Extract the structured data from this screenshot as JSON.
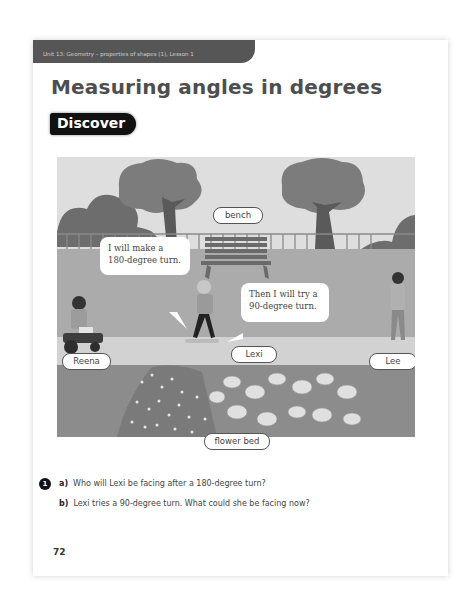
{
  "header": {
    "unit_label": "Unit 13: Geometry – properties of shapes (1), Lesson 1",
    "title": "Measuring angles in degrees",
    "section_badge": "Discover"
  },
  "illustration": {
    "labels": {
      "bench": "bench",
      "reena": "Reena",
      "lexi": "Lexi",
      "lee": "Lee",
      "flower_bed": "flower bed"
    },
    "speech_bubbles": [
      {
        "speaker": "Lexi",
        "line1": "I will make a",
        "line2": "180-degree turn."
      },
      {
        "speaker": "Lexi",
        "line1": "Then I will try a",
        "line2": "90-degree turn."
      }
    ]
  },
  "questions": {
    "number": "1",
    "items": [
      {
        "letter": "a)",
        "text": "Who will Lexi be facing after a 180-degree turn?"
      },
      {
        "letter": "b)",
        "text": "Lexi tries a 90-degree turn. What could she be facing now?"
      }
    ]
  },
  "footer": {
    "page_number": "72"
  }
}
